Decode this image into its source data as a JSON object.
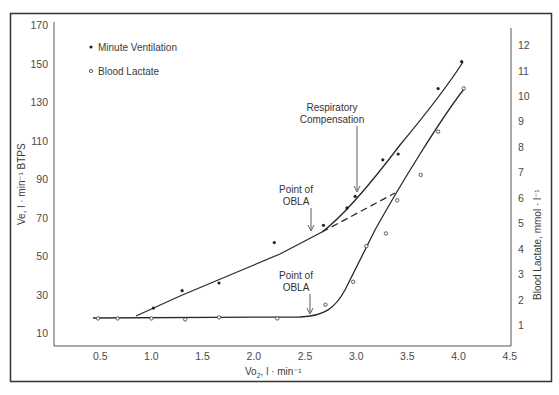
{
  "chart_data": {
    "type": "line",
    "title": "",
    "xlabel": "Vo2, l·min-1",
    "ylabel": "Ve, l·min-1 BTPS",
    "y2label": "Blood Lactate, mmol·l-1",
    "xlim": [
      0,
      4.5
    ],
    "ylim": [
      10,
      170
    ],
    "y2lim": [
      1,
      12
    ],
    "x_ticks": [
      "0.5",
      "1.0",
      "1.5",
      "2.0",
      "2.5",
      "3.0",
      "3.5",
      "4.0",
      "4.5"
    ],
    "y_ticks": [
      "10",
      "30",
      "50",
      "70",
      "90",
      "110",
      "130",
      "150",
      "170"
    ],
    "y2_ticks": [
      "1",
      "2",
      "3",
      "4",
      "5",
      "6",
      "7",
      "8",
      "9",
      "10",
      "11",
      "12"
    ],
    "grid": false,
    "legend_position": "upper-left",
    "series": [
      {
        "name": "Minute Ventilation",
        "marker": "filled-dot",
        "axis": "left",
        "x": [
          1.02,
          1.3,
          1.66,
          2.2,
          2.68,
          2.91,
          2.99,
          3.26,
          3.41,
          3.8,
          4.03
        ],
        "values": [
          23,
          32,
          36,
          57,
          66,
          75,
          81,
          100,
          103,
          137,
          151
        ]
      },
      {
        "name": "Blood Lactate",
        "marker": "open-circle",
        "axis": "right",
        "x": [
          0.48,
          0.67,
          1.0,
          1.33,
          1.66,
          2.23,
          2.7,
          2.97,
          3.1,
          3.29,
          3.4,
          3.63,
          3.8,
          4.05
        ],
        "values": [
          1.26,
          1.26,
          1.26,
          1.22,
          1.3,
          1.26,
          1.8,
          2.7,
          4.1,
          4.6,
          5.9,
          6.9,
          8.6,
          10.3
        ]
      }
    ],
    "annotations": [
      {
        "text": "Respiratory Compensation",
        "x": 3.0,
        "y": 81,
        "axis": "left"
      },
      {
        "text": "Point of OBLA",
        "x": 2.6,
        "y": 65,
        "axis": "left"
      },
      {
        "text": "Point of OBLA",
        "x": 2.6,
        "y": 1.4,
        "axis": "right"
      }
    ]
  },
  "legend": {
    "items": [
      "Minute Ventilation",
      "Blood Lactate"
    ]
  },
  "axes": {
    "left_label": "Ve, l · min⁻¹ BTPS",
    "right_label": "Blood Lactate, mmol · l⁻¹",
    "x_label_main": "Vo",
    "x_label_sub": "2",
    "x_label_rest": ", l · min⁻¹"
  },
  "annotations": {
    "resp_line1": "Respiratory",
    "resp_line2": "Compensation",
    "obla_upper_line1": "Point of",
    "obla_upper_line2": "OBLA",
    "obla_lower_line1": "Point of",
    "obla_lower_line2": "OBLA"
  }
}
